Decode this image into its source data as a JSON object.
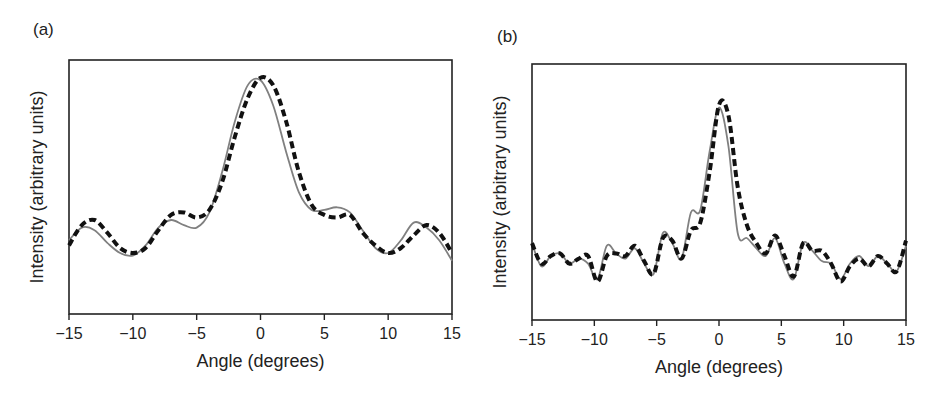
{
  "figure": {
    "panels": [
      {
        "label": "(a)"
      },
      {
        "label": "(b)"
      }
    ]
  },
  "chart_data": [
    {
      "panel": "(a)",
      "type": "line",
      "title": "",
      "xlabel": "Angle (degrees)",
      "ylabel": "Intensity (arbitrary units)",
      "xlim": [
        -15,
        15
      ],
      "ylim": [
        0,
        1
      ],
      "xticks": [
        -15,
        -10,
        -5,
        0,
        5,
        10,
        15
      ],
      "xtick_labels": [
        "−15",
        "−10",
        "−5",
        "0",
        "5",
        "10",
        "15"
      ],
      "yticks": [],
      "grid": false,
      "legend": null,
      "x": [
        -15,
        -14,
        -13,
        -12,
        -11,
        -10,
        -9,
        -8,
        -7,
        -6,
        -5,
        -4,
        -3,
        -2,
        -1,
        0,
        1,
        2,
        3,
        4,
        5,
        6,
        7,
        8,
        9,
        10,
        11,
        12,
        13,
        14,
        15
      ],
      "series": [
        {
          "name": "solid gray",
          "style": "solid",
          "color": "#808080",
          "values": [
            0.29,
            0.34,
            0.33,
            0.28,
            0.24,
            0.23,
            0.27,
            0.34,
            0.37,
            0.35,
            0.34,
            0.4,
            0.56,
            0.76,
            0.9,
            0.92,
            0.82,
            0.64,
            0.48,
            0.41,
            0.41,
            0.42,
            0.4,
            0.33,
            0.26,
            0.24,
            0.29,
            0.36,
            0.34,
            0.29,
            0.21
          ]
        },
        {
          "name": "dashed black",
          "style": "dashed",
          "color": "#111111",
          "values": [
            0.27,
            0.35,
            0.37,
            0.32,
            0.26,
            0.24,
            0.26,
            0.33,
            0.39,
            0.4,
            0.38,
            0.41,
            0.52,
            0.7,
            0.85,
            0.93,
            0.9,
            0.76,
            0.56,
            0.43,
            0.39,
            0.38,
            0.39,
            0.32,
            0.27,
            0.24,
            0.26,
            0.31,
            0.35,
            0.32,
            0.24
          ]
        }
      ]
    },
    {
      "panel": "(b)",
      "type": "line",
      "title": "",
      "xlabel": "Angle (degrees)",
      "ylabel": "Intensity (arbitrary units)",
      "xlim": [
        -15,
        15
      ],
      "ylim": [
        0,
        1
      ],
      "xticks": [
        -15,
        -10,
        -5,
        0,
        5,
        10,
        15
      ],
      "xtick_labels": [
        "−15",
        "−10",
        "−5",
        "0",
        "5",
        "10",
        "15"
      ],
      "yticks": [],
      "grid": false,
      "legend": null,
      "x": [
        -15,
        -14.25,
        -13.5,
        -12.75,
        -12,
        -11.25,
        -10.5,
        -9.75,
        -9,
        -8.25,
        -7.5,
        -6.75,
        -6,
        -5.25,
        -4.5,
        -3.75,
        -3,
        -2.25,
        -1.5,
        -0.75,
        0,
        0.75,
        1.5,
        2.25,
        3,
        3.75,
        4.5,
        5.25,
        6,
        6.75,
        7.5,
        8.25,
        9,
        9.75,
        10.5,
        11.25,
        12,
        12.75,
        13.5,
        14.25,
        15
      ],
      "series": [
        {
          "name": "solid gray",
          "style": "solid",
          "color": "#808080",
          "values": [
            0.3,
            0.21,
            0.25,
            0.26,
            0.22,
            0.24,
            0.22,
            0.16,
            0.29,
            0.26,
            0.24,
            0.28,
            0.22,
            0.18,
            0.34,
            0.3,
            0.24,
            0.42,
            0.43,
            0.66,
            0.83,
            0.68,
            0.34,
            0.32,
            0.28,
            0.25,
            0.32,
            0.22,
            0.16,
            0.3,
            0.27,
            0.23,
            0.22,
            0.16,
            0.22,
            0.25,
            0.21,
            0.25,
            0.22,
            0.19,
            0.29
          ]
        },
        {
          "name": "dashed black",
          "style": "dashed",
          "color": "#111111",
          "values": [
            0.3,
            0.22,
            0.25,
            0.26,
            0.22,
            0.24,
            0.25,
            0.15,
            0.25,
            0.26,
            0.25,
            0.29,
            0.23,
            0.18,
            0.32,
            0.31,
            0.24,
            0.35,
            0.38,
            0.58,
            0.84,
            0.8,
            0.52,
            0.37,
            0.3,
            0.26,
            0.33,
            0.25,
            0.17,
            0.3,
            0.27,
            0.27,
            0.22,
            0.15,
            0.21,
            0.24,
            0.21,
            0.25,
            0.22,
            0.19,
            0.31
          ]
        }
      ]
    }
  ]
}
